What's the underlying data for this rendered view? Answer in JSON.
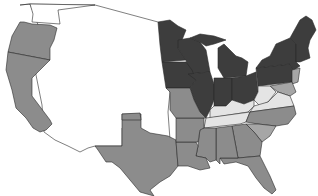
{
  "map": {
    "title": "",
    "region": "Contiguous United States",
    "legend_visible": false,
    "shades": {
      "dark": "#3d3d3d",
      "medium": "#8c8c8c",
      "medium_light": "#a6a6a6",
      "light": "#e4e4e4",
      "none": "#ffffff"
    },
    "states": [
      {
        "id": "WA",
        "shade": "none"
      },
      {
        "id": "OR",
        "shade": "medium"
      },
      {
        "id": "CA",
        "shade": "medium"
      },
      {
        "id": "west-territories",
        "shade": "none"
      },
      {
        "id": "MN",
        "shade": "dark"
      },
      {
        "id": "WI",
        "shade": "dark"
      },
      {
        "id": "MI",
        "shade": "dark"
      },
      {
        "id": "IA",
        "shade": "dark"
      },
      {
        "id": "IL",
        "shade": "dark"
      },
      {
        "id": "IN",
        "shade": "dark"
      },
      {
        "id": "OH",
        "shade": "dark"
      },
      {
        "id": "PA",
        "shade": "dark"
      },
      {
        "id": "NY",
        "shade": "dark"
      },
      {
        "id": "New-England",
        "shade": "dark"
      },
      {
        "id": "NJ",
        "shade": "medium_light"
      },
      {
        "id": "MD-DE",
        "shade": "medium_light"
      },
      {
        "id": "KS",
        "shade": "none"
      },
      {
        "id": "MO",
        "shade": "medium"
      },
      {
        "id": "KY",
        "shade": "light"
      },
      {
        "id": "WV",
        "shade": "light"
      },
      {
        "id": "VA",
        "shade": "light"
      },
      {
        "id": "TN",
        "shade": "light"
      },
      {
        "id": "NC",
        "shade": "medium"
      },
      {
        "id": "SC",
        "shade": "medium_light"
      },
      {
        "id": "GA",
        "shade": "medium"
      },
      {
        "id": "FL",
        "shade": "medium"
      },
      {
        "id": "AL",
        "shade": "medium"
      },
      {
        "id": "MS",
        "shade": "medium"
      },
      {
        "id": "LA",
        "shade": "medium"
      },
      {
        "id": "AR",
        "shade": "medium"
      },
      {
        "id": "TX",
        "shade": "medium"
      },
      {
        "id": "OK-strip",
        "shade": "medium"
      }
    ]
  }
}
